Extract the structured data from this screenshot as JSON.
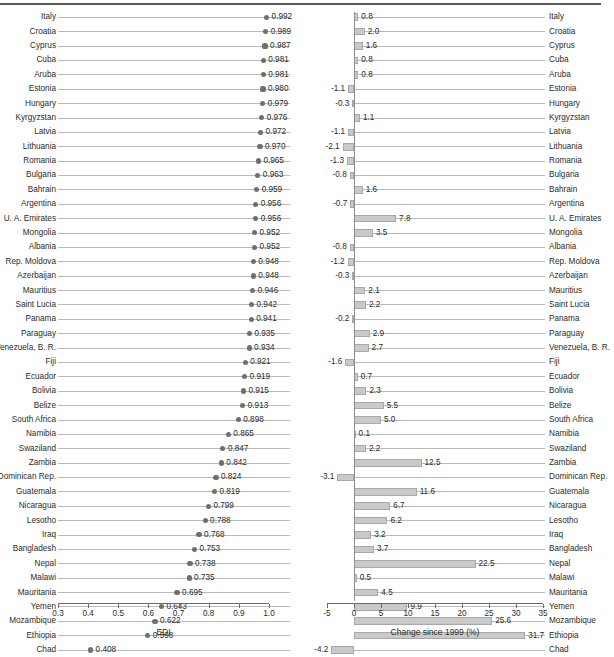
{
  "chart_data": [
    {
      "id": "edi",
      "type": "scatter",
      "title": "",
      "xlabel": "EDI",
      "ylabel": "",
      "xlim": [
        0.3,
        1.0
      ],
      "xticks": [
        0.3,
        0.4,
        0.5,
        0.6,
        0.7,
        0.8,
        0.9,
        1.0
      ],
      "xticklabels": [
        "0.3",
        "0.4",
        "0.5",
        "0.6",
        "0.7",
        "0.8",
        "0.9",
        "1.0"
      ],
      "grid": true,
      "legend": "none",
      "marker": "filled-circle",
      "marker_color": "#6f6f6f",
      "data_labels": true,
      "categories": [
        "Italy",
        "Croatia",
        "Cyprus",
        "Cuba",
        "Aruba",
        "Estonia",
        "Hungary",
        "Kyrgyzstan",
        "Latvia",
        "Lithuania",
        "Romania",
        "Bulgaria",
        "Bahrain",
        "Argentina",
        "U. A. Emirates",
        "Mongolia",
        "Albania",
        "Rep. Moldova",
        "Azerbaijan",
        "Mauritius",
        "Saint Lucia",
        "Panama",
        "Paraguay",
        "Venezuela, B. R.",
        "Fiji",
        "Ecuador",
        "Bolivia",
        "Belize",
        "South Africa",
        "Namibia",
        "Swaziland",
        "Zambia",
        "Dominican Rep.",
        "Guatemala",
        "Nicaragua",
        "Lesotho",
        "Iraq",
        "Bangladesh",
        "Nepal",
        "Malawi",
        "Mauritania",
        "Yemen",
        "Mozambique",
        "Ethiopia",
        "Chad"
      ],
      "values": [
        0.992,
        0.989,
        0.987,
        0.981,
        0.981,
        0.98,
        0.979,
        0.976,
        0.972,
        0.97,
        0.965,
        0.963,
        0.959,
        0.956,
        0.956,
        0.952,
        0.952,
        0.948,
        0.948,
        0.946,
        0.942,
        0.941,
        0.935,
        0.934,
        0.921,
        0.919,
        0.915,
        0.913,
        0.898,
        0.865,
        0.847,
        0.842,
        0.824,
        0.819,
        0.799,
        0.788,
        0.768,
        0.753,
        0.738,
        0.735,
        0.695,
        0.643,
        0.622,
        0.598,
        0.408
      ],
      "value_labels": [
        "0.992",
        "0.989",
        "0.987",
        "0.981",
        "0.981",
        "0.980",
        "0.979",
        "0.976",
        "0.972",
        "0.970",
        "0.965",
        "0.963",
        "0.959",
        "0.956",
        "0.956",
        "0.952",
        "0.952",
        "0.948",
        "0.948",
        "0.946",
        "0.942",
        "0.941",
        "0.935",
        "0.934",
        "0.921",
        "0.919",
        "0.915",
        "0.913",
        "0.898",
        "0.865",
        "0.847",
        "0.842",
        "0.824",
        "0.819",
        "0.799",
        "0.788",
        "0.768",
        "0.753",
        "0.738",
        "0.735",
        "0.695",
        "0.643",
        "0.622",
        "0.598",
        "0.408"
      ]
    },
    {
      "id": "change",
      "type": "bar",
      "orientation": "horizontal",
      "title": "",
      "xlabel": "Change since 1999 (%)",
      "ylabel": "",
      "xlim": [
        -5,
        35
      ],
      "xticks": [
        -5,
        0,
        5,
        10,
        15,
        20,
        25,
        30,
        35
      ],
      "xticklabels": [
        "-5",
        "0",
        "5",
        "10",
        "15",
        "20",
        "25",
        "30",
        "35"
      ],
      "grid": true,
      "legend": "none",
      "bar_color": "#c9c9c9",
      "bar_edge_color": "#a8a8a8",
      "data_labels": true,
      "categories": [
        "Italy",
        "Croatia",
        "Cyprus",
        "Cuba",
        "Aruba",
        "Estonia",
        "Hungary",
        "Kyrgyzstan",
        "Latvia",
        "Lithuania",
        "Romania",
        "Bulgaria",
        "Bahrain",
        "Argentina",
        "U. A. Emirates",
        "Mongolia",
        "Albania",
        "Rep. Moldova",
        "Azerbaijan",
        "Mauritius",
        "Saint Lucia",
        "Panama",
        "Paraguay",
        "Venezuela, B. R.",
        "Fiji",
        "Ecuador",
        "Bolivia",
        "Belize",
        "South Africa",
        "Namibia",
        "Swaziland",
        "Zambia",
        "Dominican Rep.",
        "Guatemala",
        "Nicaragua",
        "Lesotho",
        "Iraq",
        "Bangladesh",
        "Nepal",
        "Malawi",
        "Mauritania",
        "Yemen",
        "Mozambique",
        "Ethiopia",
        "Chad"
      ],
      "values": [
        0.8,
        2.0,
        1.6,
        0.8,
        0.8,
        -1.1,
        -0.3,
        1.1,
        -1.1,
        -2.1,
        -1.3,
        -0.8,
        1.6,
        -0.7,
        7.8,
        3.5,
        -0.8,
        -1.2,
        -0.3,
        2.1,
        2.2,
        -0.2,
        2.9,
        2.7,
        -1.6,
        0.7,
        2.3,
        5.5,
        5.0,
        0.1,
        2.2,
        12.5,
        -3.1,
        11.6,
        6.7,
        6.2,
        3.2,
        3.7,
        22.5,
        0.5,
        4.5,
        9.9,
        25.6,
        31.7,
        -4.2
      ],
      "value_labels": [
        "0.8",
        "2.0",
        "1.6",
        "0.8",
        "0.8",
        "-1.1",
        "-0.3",
        "1.1",
        "-1.1",
        "-2.1",
        "-1.3",
        "-0.8",
        "1.6",
        "-0.7",
        "7.8",
        "3.5",
        "-0.8",
        "-1.2",
        "-0.3",
        "2.1",
        "2.2",
        "-0.2",
        "2.9",
        "2.7",
        "-1.6",
        "0.7",
        "2.3",
        "5.5",
        "5.0",
        "0.1",
        "2.2",
        "12.5",
        "-3.1",
        "11.6",
        "6.7",
        "6.2",
        "3.2",
        "3.7",
        "22.5",
        "0.5",
        "4.5",
        "9.9",
        "25.6",
        "31.7",
        "-4.2"
      ]
    }
  ]
}
